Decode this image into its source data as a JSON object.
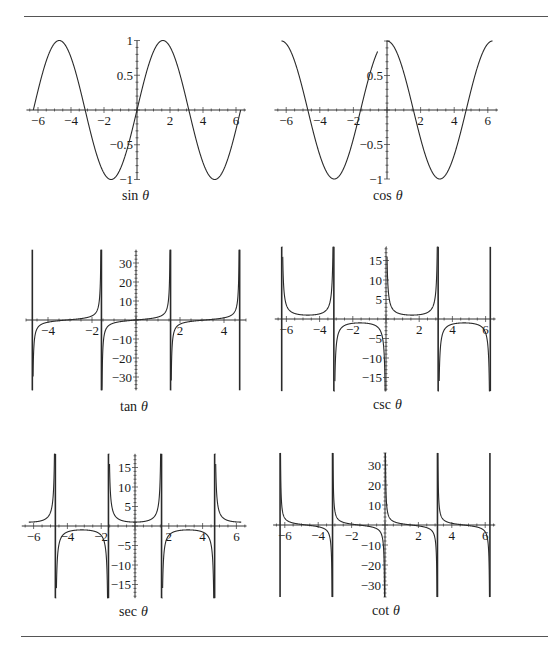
{
  "chart_data": [
    {
      "type": "line",
      "title": "sin θ",
      "function": "sin",
      "x_range": [
        -6.2832,
        6.2832
      ],
      "xlim": [
        -6.7,
        6.6
      ],
      "ylim": [
        -1,
        1
      ],
      "x_ticks": [
        -6,
        -4,
        -2,
        2,
        4,
        6
      ],
      "y_ticks": [
        1,
        0.5,
        -0.5,
        -1
      ],
      "y_tick_labels": [
        "1",
        "0.5",
        "−0.5",
        "−1"
      ],
      "x_tick_labels": [
        "−6",
        "−4",
        "−2",
        "2",
        "4",
        "6"
      ],
      "grid": false,
      "label": "sin",
      "box": {
        "x0": 137,
        "y0": 110,
        "px_per_x": 16.5,
        "px_per_y": 69.5
      },
      "sample_points": {
        "x": [
          -6.28,
          -4.71,
          -3.14,
          -1.57,
          0,
          1.57,
          3.14,
          4.71,
          6.28
        ],
        "y": [
          0,
          1,
          0,
          -1,
          0,
          1,
          0,
          -1,
          0
        ]
      }
    },
    {
      "type": "line",
      "title": "cos θ",
      "function": "cos",
      "x_range": [
        -6.2832,
        6.2832
      ],
      "xlim": [
        -6.7,
        6.6
      ],
      "ylim": [
        -1,
        1
      ],
      "x_ticks": [
        -6,
        -4,
        -2,
        2,
        4,
        6
      ],
      "y_ticks": [
        0.5,
        -0.5,
        -1
      ],
      "y_tick_labels": [
        "0.5",
        "−0.5",
        "−1"
      ],
      "x_tick_labels": [
        "−6",
        "−4",
        "−2",
        "2",
        "4",
        "6"
      ],
      "grid": false,
      "label": "cos",
      "box": {
        "x0": 387,
        "y0": 110,
        "px_per_x": 16.8,
        "px_per_y": 69
      },
      "gaps": [
        [
          -0.55,
          -0.04
        ]
      ],
      "sample_points": {
        "x": [
          -6.28,
          -4.71,
          -3.14,
          -1.57,
          0,
          1.57,
          3.14,
          4.71,
          6.28
        ],
        "y": [
          1,
          0,
          -1,
          0,
          1,
          0,
          -1,
          0,
          1
        ]
      }
    },
    {
      "type": "line",
      "title": "tan θ",
      "function": "tan",
      "x_range": [
        -4.7124,
        4.7124
      ],
      "xlim": [
        -5.0,
        5.0
      ],
      "ylim": [
        -37,
        37
      ],
      "asymptotes": [
        -4.7124,
        -1.5708,
        1.5708,
        4.7124
      ],
      "x_ticks": [
        -4,
        -2,
        2,
        4
      ],
      "y_ticks": [
        30,
        20,
        10,
        -10,
        -20,
        -30
      ],
      "y_tick_labels": [
        "30",
        "20",
        "10",
        "−10",
        "−20",
        "−30"
      ],
      "x_tick_labels": [
        "−4",
        "−2",
        "2",
        "4"
      ],
      "grid": false,
      "label": "tan",
      "box": {
        "x0": 136,
        "y0": 320,
        "px_per_x": 22,
        "px_per_y": 1.9
      }
    },
    {
      "type": "line",
      "title": "csc θ",
      "function": "csc",
      "x_range": [
        -6.2832,
        6.2832
      ],
      "xlim": [
        -6.7,
        6.6
      ],
      "ylim": [
        -18.5,
        18.5
      ],
      "asymptotes": [
        -6.2832,
        -3.1416,
        0,
        3.1416,
        6.2832
      ],
      "x_ticks": [
        -6,
        -4,
        -2,
        2,
        4,
        6
      ],
      "y_ticks": [
        15,
        10,
        5,
        -5,
        -10,
        -15
      ],
      "y_tick_labels": [
        "15",
        "10",
        "5",
        "−5",
        "−10",
        "−15"
      ],
      "x_tick_labels": [
        "−6",
        "−4",
        "−2",
        "2",
        "4",
        "6"
      ],
      "grid": false,
      "label": "csc",
      "box": {
        "x0": 386,
        "y0": 319,
        "px_per_x": 16.6,
        "px_per_y": 3.9
      }
    },
    {
      "type": "line",
      "title": "sec θ",
      "function": "sec",
      "x_range": [
        -6.2832,
        6.2832
      ],
      "xlim": [
        -6.7,
        6.6
      ],
      "ylim": [
        -18.5,
        18.5
      ],
      "asymptotes": [
        -4.7124,
        -1.5708,
        1.5708,
        4.7124
      ],
      "x_ticks": [
        -6,
        -4,
        -2,
        2,
        4,
        6
      ],
      "y_ticks": [
        15,
        10,
        5,
        -5,
        -10,
        -15
      ],
      "y_tick_labels": [
        "15",
        "10",
        "5",
        "−5",
        "−10",
        "−15"
      ],
      "x_tick_labels": [
        "−6",
        "−4",
        "−2",
        "2",
        "4",
        "6"
      ],
      "grid": false,
      "label": "sec",
      "box": {
        "x0": 135,
        "y0": 526,
        "px_per_x": 16.9,
        "px_per_y": 3.9
      }
    },
    {
      "type": "line",
      "title": "cot θ",
      "function": "cot",
      "x_range": [
        -6.2832,
        6.2832
      ],
      "xlim": [
        -6.7,
        6.6
      ],
      "ylim": [
        -36,
        36
      ],
      "asymptotes": [
        -6.2832,
        -3.1416,
        0,
        3.1416,
        6.2832
      ],
      "x_ticks": [
        -6,
        -4,
        -2,
        2,
        4,
        6
      ],
      "y_ticks": [
        30,
        20,
        10,
        -10,
        -20,
        -30
      ],
      "y_tick_labels": [
        "30",
        "20",
        "10",
        "−10",
        "−20",
        "−30"
      ],
      "x_tick_labels": [
        "−6",
        "−4",
        "−2",
        "2",
        "4",
        "6"
      ],
      "grid": false,
      "label": "cot",
      "box": {
        "x0": 385,
        "y0": 525,
        "px_per_x": 16.7,
        "px_per_y": 2.0
      }
    }
  ],
  "captions": {
    "sin": {
      "fn": "sin",
      "var": "θ"
    },
    "cos": {
      "fn": "cos",
      "var": "θ"
    },
    "tan": {
      "fn": "tan",
      "var": "θ"
    },
    "csc": {
      "fn": "csc",
      "var": "θ"
    },
    "sec": {
      "fn": "sec",
      "var": "θ"
    },
    "cot": {
      "fn": "cot",
      "var": "θ"
    }
  },
  "colors": {
    "curve": "#2a2a2a",
    "axis": "#333333",
    "rule": "#555555"
  }
}
